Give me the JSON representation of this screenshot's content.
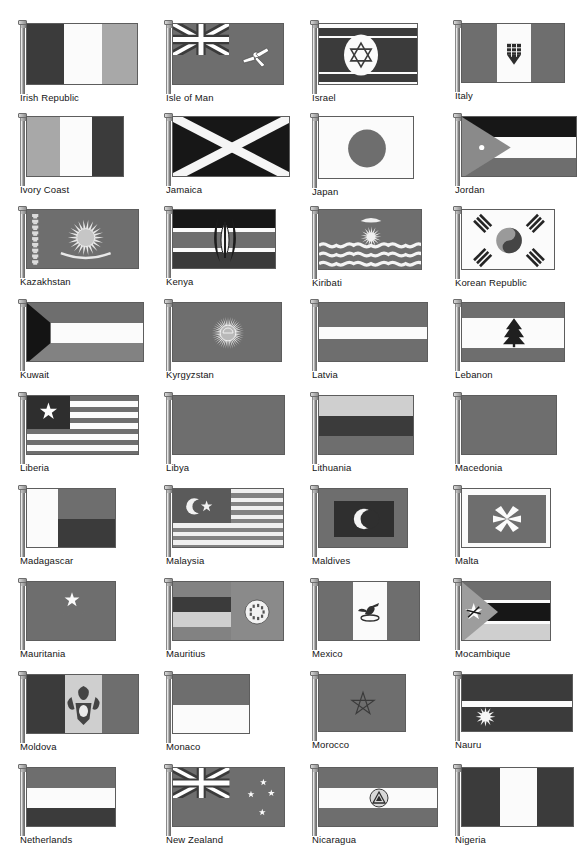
{
  "page": {
    "kind": "scanned-book-page",
    "background": "#ffffff",
    "columns": 4,
    "rows": 9,
    "label_color": "#151515",
    "palette": {
      "dark": "#3b3b3b",
      "black": "#171717",
      "mid": "#6e6e6e",
      "mid2": "#828282",
      "light": "#a8a8a8",
      "pale": "#cfcfcf",
      "white": "#fbfbfb"
    }
  },
  "flags": [
    {
      "id": "irish-republic",
      "label": "Irish Republic",
      "col": 0,
      "row": 0,
      "w": 112,
      "h": 62
    },
    {
      "id": "isle-of-man",
      "label": "Isle of Man",
      "col": 1,
      "row": 0,
      "w": 112,
      "h": 62
    },
    {
      "id": "israel",
      "label": "Israel",
      "col": 2,
      "row": 0,
      "w": 100,
      "h": 62
    },
    {
      "id": "italy",
      "label": "Italy",
      "col": 3,
      "row": 0,
      "w": 104,
      "h": 60
    },
    {
      "id": "ivory-coast",
      "label": "Ivory Coast",
      "col": 0,
      "row": 1,
      "w": 98,
      "h": 61
    },
    {
      "id": "jamaica",
      "label": "Jamaica",
      "col": 1,
      "row": 1,
      "w": 118,
      "h": 61
    },
    {
      "id": "japan",
      "label": "Japan",
      "col": 2,
      "row": 1,
      "w": 96,
      "h": 63
    },
    {
      "id": "jordan",
      "label": "Jordan",
      "col": 3,
      "row": 1,
      "w": 116,
      "h": 61
    },
    {
      "id": "kazakhstan",
      "label": "Kazakhstan",
      "col": 0,
      "row": 2,
      "w": 113,
      "h": 60
    },
    {
      "id": "kenya",
      "label": "Kenya",
      "col": 1,
      "row": 2,
      "w": 104,
      "h": 60
    },
    {
      "id": "kiribati",
      "label": "Kiribati",
      "col": 2,
      "row": 2,
      "w": 104,
      "h": 61
    },
    {
      "id": "korean-republic",
      "label": "Korean Republic",
      "col": 3,
      "row": 2,
      "w": 94,
      "h": 61
    },
    {
      "id": "kuwait",
      "label": "Kuwait",
      "col": 0,
      "row": 3,
      "w": 118,
      "h": 60
    },
    {
      "id": "kyrgyzstan",
      "label": "Kyrgyzstan",
      "col": 1,
      "row": 3,
      "w": 110,
      "h": 60
    },
    {
      "id": "latvia",
      "label": "Latvia",
      "col": 2,
      "row": 3,
      "w": 110,
      "h": 60
    },
    {
      "id": "lebanon",
      "label": "Lebanon",
      "col": 3,
      "row": 3,
      "w": 104,
      "h": 60
    },
    {
      "id": "liberia",
      "label": "Liberia",
      "col": 0,
      "row": 4,
      "w": 113,
      "h": 60
    },
    {
      "id": "libya",
      "label": "Libya",
      "col": 1,
      "row": 4,
      "w": 113,
      "h": 60
    },
    {
      "id": "lithuania",
      "label": "Lithuania",
      "col": 2,
      "row": 4,
      "w": 96,
      "h": 60
    },
    {
      "id": "macedonia",
      "label": "Macedonia",
      "col": 3,
      "row": 4,
      "w": 96,
      "h": 60
    },
    {
      "id": "madagascar",
      "label": "Madagascar",
      "col": 0,
      "row": 5,
      "w": 90,
      "h": 60
    },
    {
      "id": "malaysia",
      "label": "Malaysia",
      "col": 1,
      "row": 5,
      "w": 112,
      "h": 60
    },
    {
      "id": "maldives",
      "label": "Maldives",
      "col": 2,
      "row": 5,
      "w": 90,
      "h": 60
    },
    {
      "id": "malta",
      "label": "Malta",
      "col": 3,
      "row": 5,
      "w": 90,
      "h": 60
    },
    {
      "id": "mauritania",
      "label": "Mauritania",
      "col": 0,
      "row": 6,
      "w": 90,
      "h": 60
    },
    {
      "id": "mauritius",
      "label": "Mauritius",
      "col": 1,
      "row": 6,
      "w": 112,
      "h": 60
    },
    {
      "id": "mexico",
      "label": "Mexico",
      "col": 2,
      "row": 6,
      "w": 102,
      "h": 60
    },
    {
      "id": "mocambique",
      "label": "Mocambique",
      "col": 3,
      "row": 6,
      "w": 90,
      "h": 60
    },
    {
      "id": "moldova",
      "label": "Moldova",
      "col": 0,
      "row": 7,
      "w": 113,
      "h": 60
    },
    {
      "id": "monaco",
      "label": "Monaco",
      "col": 1,
      "row": 7,
      "w": 78,
      "h": 60
    },
    {
      "id": "morocco",
      "label": "Morocco",
      "col": 2,
      "row": 7,
      "w": 88,
      "h": 58
    },
    {
      "id": "nauru",
      "label": "Nauru",
      "col": 3,
      "row": 7,
      "w": 112,
      "h": 58
    },
    {
      "id": "netherlands",
      "label": "Netherlands",
      "col": 0,
      "row": 8,
      "w": 90,
      "h": 60
    },
    {
      "id": "new-zealand",
      "label": "New Zealand",
      "col": 1,
      "row": 8,
      "w": 113,
      "h": 60
    },
    {
      "id": "nicaragua",
      "label": "Nicaragua",
      "col": 2,
      "row": 8,
      "w": 120,
      "h": 60
    },
    {
      "id": "nigeria",
      "label": "Nigeria",
      "col": 3,
      "row": 8,
      "w": 113,
      "h": 60
    }
  ]
}
